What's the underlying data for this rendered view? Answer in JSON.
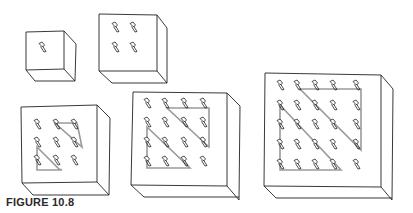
{
  "figure": {
    "caption": "FIGURE 10.8",
    "cubes": [
      {
        "grid": 1,
        "label": "1x1"
      },
      {
        "grid": 2,
        "label": "2x2"
      },
      {
        "grid": 3,
        "label": "3x3"
      },
      {
        "grid": 4,
        "label": "4x4"
      },
      {
        "grid": 5,
        "label": "5x5"
      }
    ],
    "colors": {
      "line": "#222222",
      "highlight": "#9a9a9a",
      "background": "#ffffff"
    }
  }
}
